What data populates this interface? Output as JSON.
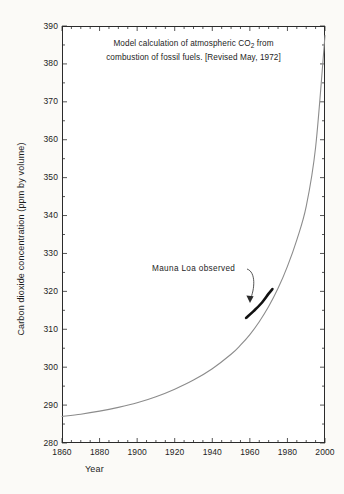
{
  "chart_data": {
    "type": "line",
    "title": "Model calculation of atmospheric CO2 from combustion of fossil fuels. [Revised May, 1972]",
    "title_lines": [
      "Model calculation of atmospheric CO",
      " from",
      "combustion of fossil fuels. [Revised May, 1972]"
    ],
    "title_subscript": "2",
    "xlabel": "Year",
    "ylabel": "Carbon dioxide concentration (ppm by volume)",
    "xlim": [
      1860,
      2000
    ],
    "ylim": [
      280,
      390
    ],
    "grid": false,
    "legend": "none",
    "x_ticks": [
      1860,
      1880,
      1900,
      1920,
      1940,
      1960,
      1980,
      2000
    ],
    "y_ticks": [
      280,
      290,
      300,
      310,
      320,
      330,
      340,
      350,
      360,
      370,
      380,
      390
    ],
    "x_minor_interval": 5,
    "y_minor_interval": 5,
    "series": [
      {
        "name": "model-calculation",
        "style": "thin-gray-curve",
        "color": "#8c8c8c",
        "x": [
          1860,
          1870,
          1880,
          1890,
          1900,
          1910,
          1920,
          1930,
          1940,
          1950,
          1955,
          1960,
          1965,
          1970,
          1975,
          1980,
          1985,
          1990,
          1995,
          2000
        ],
        "values": [
          287.0,
          287.6,
          288.4,
          289.4,
          290.6,
          292.2,
          294.2,
          296.6,
          299.6,
          303.4,
          305.8,
          308.6,
          312.0,
          316.0,
          320.8,
          326.6,
          333.6,
          342.4,
          358.0,
          387.5
        ]
      },
      {
        "name": "mauna-loa-observed",
        "style": "thick-black-segment",
        "color": "#111111",
        "x": [
          1958,
          1962,
          1966,
          1970,
          1972
        ],
        "values": [
          313.0,
          314.8,
          316.8,
          319.4,
          320.6
        ]
      }
    ],
    "annotations": [
      {
        "name": "mauna-loa-observed",
        "text": "Mauna Loa observed",
        "points_to_x": 1966,
        "points_to_y": 316.5
      }
    ]
  },
  "colors": {
    "background": "#fbfaf7",
    "plot_background": "#ffffff",
    "axis": "#2b2b2b",
    "model_curve": "#8c8c8c",
    "observed_curve": "#111111",
    "text": "#1d1d1d"
  }
}
